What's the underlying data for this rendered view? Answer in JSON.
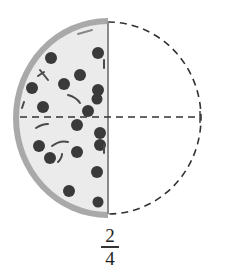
{
  "figure": {
    "total_parts": 4,
    "shaded_parts": 2,
    "shaded_side": "left",
    "colors": {
      "crust": "#a9a9a9",
      "cheese": "#e9e9e9",
      "pepperoni": "#3a3a3a",
      "dash_line": "#333333"
    }
  },
  "label": {
    "numerator": "2",
    "denominator": "4"
  }
}
